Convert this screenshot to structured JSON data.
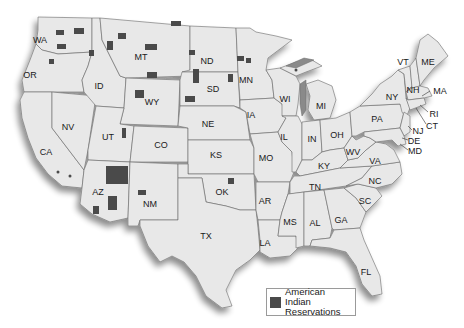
{
  "map": {
    "title": "",
    "fill_color": "#e8e8e8",
    "border_color": "#6a6a6a",
    "reservation_color": "#4a4a4a",
    "states": [
      {
        "abbr": "WA",
        "x": 40,
        "y": 40
      },
      {
        "abbr": "OR",
        "x": 30,
        "y": 75
      },
      {
        "abbr": "CA",
        "x": 46,
        "y": 152
      },
      {
        "abbr": "NV",
        "x": 68,
        "y": 127
      },
      {
        "abbr": "ID",
        "x": 99,
        "y": 86
      },
      {
        "abbr": "MT",
        "x": 141,
        "y": 57
      },
      {
        "abbr": "WY",
        "x": 152,
        "y": 102
      },
      {
        "abbr": "UT",
        "x": 108,
        "y": 137
      },
      {
        "abbr": "AZ",
        "x": 98,
        "y": 192
      },
      {
        "abbr": "CO",
        "x": 161,
        "y": 145
      },
      {
        "abbr": "NM",
        "x": 150,
        "y": 204
      },
      {
        "abbr": "ND",
        "x": 207,
        "y": 61
      },
      {
        "abbr": "SD",
        "x": 213,
        "y": 89
      },
      {
        "abbr": "NE",
        "x": 208,
        "y": 124
      },
      {
        "abbr": "KS",
        "x": 216,
        "y": 155
      },
      {
        "abbr": "OK",
        "x": 222,
        "y": 192
      },
      {
        "abbr": "TX",
        "x": 206,
        "y": 236
      },
      {
        "abbr": "MN",
        "x": 246,
        "y": 80
      },
      {
        "abbr": "IA",
        "x": 251,
        "y": 115
      },
      {
        "abbr": "MO",
        "x": 266,
        "y": 158
      },
      {
        "abbr": "AR",
        "x": 265,
        "y": 201
      },
      {
        "abbr": "LA",
        "x": 265,
        "y": 243
      },
      {
        "abbr": "WI",
        "x": 285,
        "y": 99
      },
      {
        "abbr": "IL",
        "x": 284,
        "y": 137
      },
      {
        "abbr": "MI",
        "x": 321,
        "y": 106
      },
      {
        "abbr": "IN",
        "x": 312,
        "y": 139
      },
      {
        "abbr": "OH",
        "x": 337,
        "y": 135
      },
      {
        "abbr": "KY",
        "x": 324,
        "y": 166
      },
      {
        "abbr": "TN",
        "x": 315,
        "y": 187
      },
      {
        "abbr": "MS",
        "x": 290,
        "y": 222
      },
      {
        "abbr": "AL",
        "x": 315,
        "y": 223
      },
      {
        "abbr": "GA",
        "x": 341,
        "y": 220
      },
      {
        "abbr": "FL",
        "x": 366,
        "y": 272
      },
      {
        "abbr": "SC",
        "x": 365,
        "y": 201
      },
      {
        "abbr": "NC",
        "x": 375,
        "y": 181
      },
      {
        "abbr": "VA",
        "x": 375,
        "y": 161
      },
      {
        "abbr": "WV",
        "x": 353,
        "y": 152
      },
      {
        "abbr": "PA",
        "x": 377,
        "y": 119
      },
      {
        "abbr": "NY",
        "x": 392,
        "y": 97
      },
      {
        "abbr": "VT",
        "x": 403,
        "y": 62
      },
      {
        "abbr": "NH",
        "x": 413,
        "y": 90
      },
      {
        "abbr": "ME",
        "x": 428,
        "y": 62
      },
      {
        "abbr": "MA",
        "x": 440,
        "y": 91
      },
      {
        "abbr": "RI",
        "x": 434,
        "y": 114
      },
      {
        "abbr": "CT",
        "x": 432,
        "y": 126
      },
      {
        "abbr": "NJ",
        "x": 418,
        "y": 131
      },
      {
        "abbr": "DE",
        "x": 414,
        "y": 141
      },
      {
        "abbr": "MD",
        "x": 415,
        "y": 151
      }
    ]
  },
  "legend": {
    "swatch_icon": "filled-square",
    "label_line1": "American Indian",
    "label_line2": "Reservations"
  }
}
